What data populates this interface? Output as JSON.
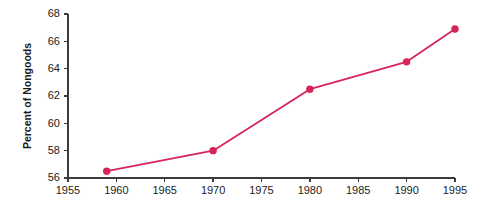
{
  "chart_data": {
    "type": "line",
    "title": "",
    "subtitle": "",
    "xlabel": "",
    "ylabel": "Percent of Nongoods",
    "xlim": [
      1955,
      1995
    ],
    "ylim": [
      56,
      68
    ],
    "grid": false,
    "legend": false,
    "legend_position": "none",
    "x_ticks": [
      1955,
      1960,
      1965,
      1970,
      1975,
      1980,
      1985,
      1990,
      1995
    ],
    "x_tick_labels": [
      "1955",
      "1960",
      "1965",
      "1970",
      "1975",
      "1980",
      "1985",
      "1990",
      "1995"
    ],
    "y_ticks": [
      56,
      58,
      60,
      62,
      64,
      66,
      68
    ],
    "y_tick_labels": [
      "56",
      "58",
      "60",
      "62",
      "64",
      "66",
      "68"
    ],
    "series": [
      {
        "name": "Percent of Nongoods",
        "color": "#d6255a",
        "marker": "circle",
        "x": [
          1959,
          1970,
          1980,
          1990,
          1995
        ],
        "values": [
          56.5,
          58.0,
          62.5,
          64.5,
          66.9
        ],
        "points": [
          {
            "x": 1959,
            "y": 56.5
          },
          {
            "x": 1970,
            "y": 58.0
          },
          {
            "x": 1980,
            "y": 62.5
          },
          {
            "x": 1990,
            "y": 64.5
          },
          {
            "x": 1995,
            "y": 66.9
          }
        ]
      }
    ],
    "colors": {
      "series": "#d6255a",
      "axis": "#3b3b3b",
      "text": "#222222",
      "background": "#ffffff"
    }
  }
}
